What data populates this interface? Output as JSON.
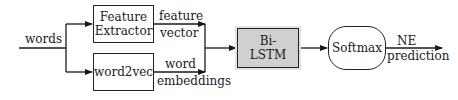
{
  "diagram": {
    "input_label": "words",
    "nodes": {
      "feature_extractor": {
        "line1": "Feature",
        "line2": "Extractor"
      },
      "word2vec": {
        "label": "word2vec"
      },
      "bilstm": {
        "line1": "Bi-",
        "line2": "LSTM",
        "fill": "#d0d0d0"
      },
      "softmax": {
        "label": "Softmax"
      }
    },
    "edges": {
      "feature_vector": {
        "line1": "feature",
        "line2": "vector"
      },
      "word_embeddings": {
        "line1": "word",
        "line2": "embeddings"
      },
      "output": {
        "line1": "NE",
        "line2": "prediction"
      }
    }
  }
}
